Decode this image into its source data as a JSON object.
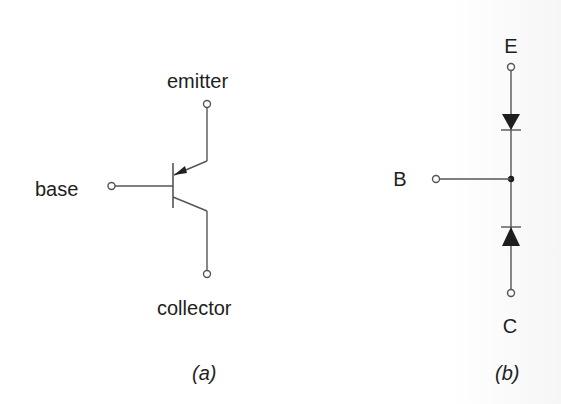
{
  "figure_a": {
    "caption": "(a)",
    "labels": {
      "emitter": "emitter",
      "base": "base",
      "collector": "collector"
    },
    "component": "PNP bipolar junction transistor symbol"
  },
  "figure_b": {
    "caption": "(b)",
    "labels": {
      "emitter": "E",
      "base": "B",
      "collector": "C"
    },
    "component": "Two-diode equivalent model (diodes pointing toward base node)"
  },
  "colors": {
    "line": "#555555",
    "text": "#1e1e1e",
    "background": "#ffffff"
  }
}
